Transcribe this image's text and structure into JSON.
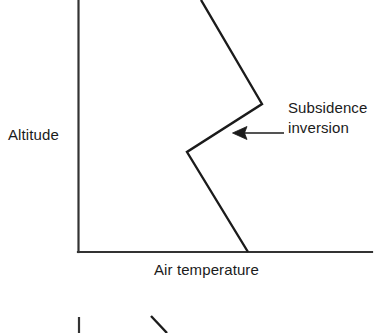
{
  "figure": {
    "title_visible": false,
    "axes": {
      "y_axis_label": "Altitude",
      "x_axis_label": "Air temperature"
    },
    "annotation": {
      "line_1": "Subsidence",
      "line_2": "inversion",
      "arrow_icon": "left-arrow-icon"
    },
    "colors": {
      "ink": "#1b1b1b",
      "axis": "#333333",
      "background": "#ffffff"
    }
  },
  "chart_data": {
    "type": "line",
    "title": "",
    "xlabel": "Air temperature",
    "ylabel": "Altitude",
    "grid": false,
    "legend": "none",
    "axis_ticks": {
      "x": [],
      "y": []
    },
    "axis_pixel_frame": {
      "origin_x": 78.5,
      "origin_y": 252,
      "x_axis_end_x": 372,
      "y_axis_top_y": 0
    },
    "series": [
      {
        "name": "Temperature profile with subsidence inversion",
        "description": "Temperature decreases with height, then a warm inversion layer, then decreases again aloft",
        "points_pixel": [
          [
            248,
            252
          ],
          [
            187,
            152
          ],
          [
            262,
            104
          ],
          [
            201,
            0
          ]
        ],
        "segments": [
          {
            "name": "surface-layer-lapse",
            "from": [
              248,
              252
            ],
            "to": [
              187,
              152
            ]
          },
          {
            "name": "inversion-layer-warming",
            "from": [
              187,
              152
            ],
            "to": [
              262,
              104
            ]
          },
          {
            "name": "upper-layer-lapse",
            "from": [
              262,
              104
            ],
            "to": [
              201,
              0
            ]
          }
        ]
      }
    ],
    "annotations": [
      {
        "text": "Subsidence inversion",
        "arrow_from_pixel": [
          283,
          133
        ],
        "arrow_to_pixel": [
          233,
          133
        ]
      }
    ],
    "partial_figure_below": {
      "description": "Top edge of a second cropped figure at the bottom of the image",
      "marks_pixel": [
        {
          "name": "axis-stub",
          "from": [
            79,
            317
          ],
          "to": [
            79,
            333
          ]
        },
        {
          "name": "line-stub",
          "from": [
            151,
            316
          ],
          "to": [
            167,
            333
          ]
        }
      ]
    }
  }
}
